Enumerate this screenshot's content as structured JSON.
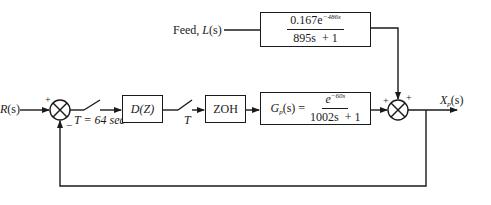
{
  "diagram": {
    "type": "block-diagram",
    "input": {
      "label": "R",
      "arg": "(s)"
    },
    "feed": {
      "label_prefix": "Feed, ",
      "label_var": "L",
      "label_arg": "(s)",
      "transfer_function": {
        "numerator_coeff": "0.167e",
        "numerator_exp": "−486s",
        "denominator": "895s  + 1"
      }
    },
    "summer1": {
      "top_sign": "+",
      "bottom_sign": "−"
    },
    "sampler1": {
      "label": "T = 64 sec"
    },
    "controller": {
      "label": "D(Z)"
    },
    "sampler2": {
      "label": "T"
    },
    "zoh": {
      "label": "ZOH"
    },
    "plant": {
      "lhs_var": "G",
      "lhs_sub": "p",
      "lhs_arg": "(s) =",
      "numerator_base": "e",
      "numerator_exp": "−60s",
      "denominator": "1002s  + 1"
    },
    "summer2": {
      "left_sign": "+",
      "top_sign": "+"
    },
    "output": {
      "label_var": "X",
      "label_sub": "p",
      "label_arg": "(s)"
    },
    "colors": {
      "line": "#1a1a1a",
      "background": "#ffffff"
    }
  }
}
